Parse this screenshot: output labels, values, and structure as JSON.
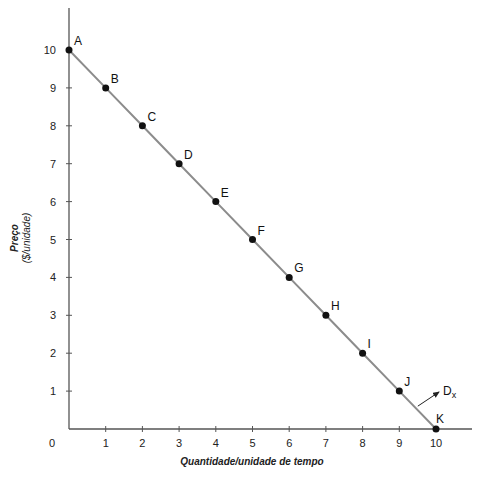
{
  "chart_data": {
    "type": "line",
    "title": "",
    "xlabel": "Quantidade/unidade de tempo",
    "ylabel": "Preço",
    "ylabel_unit": "($/unidade)",
    "xlim": [
      0,
      10
    ],
    "ylim": [
      0,
      10
    ],
    "x_ticks": [
      1,
      2,
      3,
      4,
      5,
      6,
      7,
      8,
      9,
      10
    ],
    "y_ticks": [
      1,
      2,
      3,
      4,
      5,
      6,
      7,
      8,
      9,
      10
    ],
    "origin_label": "0",
    "grid": false,
    "series": [
      {
        "name": "Dx",
        "color": "#8c8c8c",
        "points": [
          {
            "label": "A",
            "x": 0,
            "y": 10
          },
          {
            "label": "B",
            "x": 1,
            "y": 9
          },
          {
            "label": "C",
            "x": 2,
            "y": 8
          },
          {
            "label": "D",
            "x": 3,
            "y": 7
          },
          {
            "label": "E",
            "x": 4,
            "y": 6
          },
          {
            "label": "F",
            "x": 5,
            "y": 5
          },
          {
            "label": "G",
            "x": 6,
            "y": 4
          },
          {
            "label": "H",
            "x": 7,
            "y": 3
          },
          {
            "label": "I",
            "x": 8,
            "y": 2
          },
          {
            "label": "J",
            "x": 9,
            "y": 1
          },
          {
            "label": "K",
            "x": 10,
            "y": 0
          }
        ]
      }
    ],
    "annotations": [
      {
        "text": "D",
        "subscript": "x",
        "points_to": "demand-curve"
      }
    ]
  }
}
